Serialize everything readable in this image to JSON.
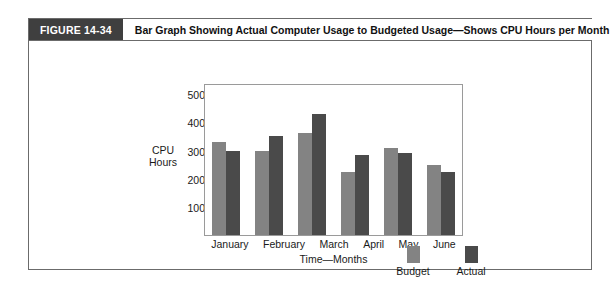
{
  "figure": {
    "tag": "FIGURE 14-34",
    "title": "Bar Graph Showing Actual Computer Usage to Budgeted Usage—Shows CPU Hours per Month"
  },
  "chart_data": {
    "type": "bar",
    "title": "",
    "categories": [
      "January",
      "February",
      "March",
      "April",
      "May",
      "June"
    ],
    "series": [
      {
        "name": "Budget",
        "color": "#838383",
        "values": [
          330,
          300,
          362,
          225,
          310,
          248
        ]
      },
      {
        "name": "Actual",
        "color": "#4a4a4a",
        "values": [
          300,
          350,
          430,
          285,
          290,
          225
        ]
      }
    ],
    "xlabel": "Time—Months",
    "ylabel": "CPU Hours",
    "ylabel_lines": [
      "CPU",
      "Hours"
    ],
    "ylim": [
      0,
      540
    ],
    "yticks": [
      100,
      200,
      300,
      400,
      500
    ],
    "ytick_labels": [
      "100",
      "200",
      "300",
      "400",
      "500"
    ],
    "grid": false,
    "legend_position": "bottom-right",
    "legend_entries": [
      "Budget",
      "Actual"
    ]
  }
}
